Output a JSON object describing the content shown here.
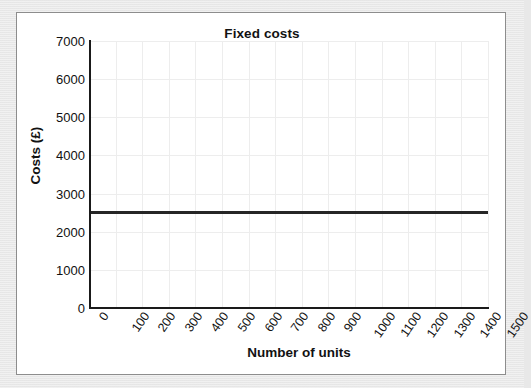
{
  "figure": {
    "background_color": "#e8e8e8",
    "card_background": "#ffffff",
    "card_border_color": "#8d8d8d"
  },
  "chart_data": {
    "type": "line",
    "title": "Fixed costs",
    "xlabel": "Number of units",
    "ylabel": "Costs (£)",
    "xlim": [
      0,
      1500
    ],
    "ylim": [
      0,
      7000
    ],
    "grid": true,
    "legend": "none",
    "x_ticks": [
      "0",
      "100",
      "200",
      "300",
      "400",
      "500",
      "600",
      "700",
      "800",
      "900",
      "1000",
      "1100",
      "1200",
      "1300",
      "1400",
      "1500"
    ],
    "x_tick_values": [
      0,
      100,
      200,
      300,
      400,
      500,
      600,
      700,
      800,
      900,
      1000,
      1100,
      1200,
      1300,
      1400,
      1500
    ],
    "y_ticks": [
      "7000",
      "6000",
      "5000",
      "4000",
      "3000",
      "2000",
      "1000",
      "0"
    ],
    "y_tick_values": [
      7000,
      6000,
      5000,
      4000,
      3000,
      2000,
      1000,
      0
    ],
    "series": [
      {
        "name": "Fixed costs",
        "color": "#262626",
        "x": [
          0,
          1500
        ],
        "values": [
          2500,
          2500
        ],
        "constant_value": 2500,
        "style": "solid-horizontal"
      }
    ],
    "annotations": []
  }
}
